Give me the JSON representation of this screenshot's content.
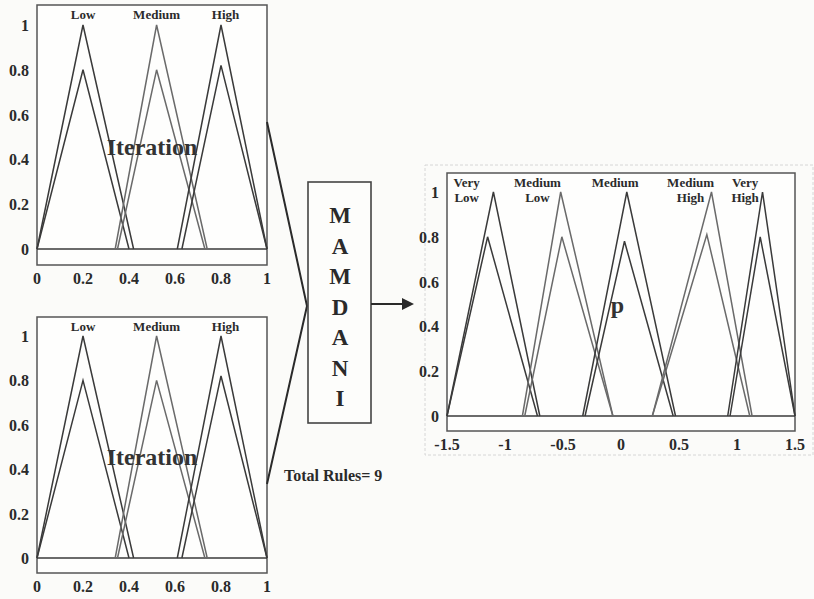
{
  "diagram": {
    "engine_label_letters": [
      "M",
      "A",
      "M",
      "D",
      "A",
      "N",
      "I"
    ],
    "total_rules_label": "Total Rules= 9",
    "colors": {
      "line": "#3a3a3a",
      "light_line": "#8a8a8a",
      "background": "#fbfbf9"
    }
  },
  "chart_data": [
    {
      "type": "line",
      "name": "input-1",
      "title": "Iteration",
      "xlim": [
        0,
        1
      ],
      "ylim": [
        0,
        1
      ],
      "xticks": [
        "0",
        "0.2",
        "0.4",
        "0.6",
        "0.8",
        "1"
      ],
      "yticks": [
        "0",
        "0.2",
        "0.4",
        "0.6",
        "0.8",
        "1"
      ],
      "series": [
        {
          "name": "Low",
          "label_x": 0.2,
          "outer": [
            [
              0,
              0
            ],
            [
              0.2,
              1
            ],
            [
              0.42,
              0
            ]
          ],
          "inner": [
            [
              0,
              0
            ],
            [
              0.2,
              0.8
            ],
            [
              0.4,
              0
            ]
          ]
        },
        {
          "name": "Medium",
          "label_x": 0.52,
          "outer": [
            [
              0.34,
              0
            ],
            [
              0.52,
              1
            ],
            [
              0.74,
              0
            ]
          ],
          "inner": [
            [
              0.35,
              0
            ],
            [
              0.52,
              0.8
            ],
            [
              0.73,
              0
            ]
          ]
        },
        {
          "name": "High",
          "label_x": 0.82,
          "outer": [
            [
              0.61,
              0
            ],
            [
              0.8,
              1
            ],
            [
              1.0,
              0
            ]
          ],
          "inner": [
            [
              0.63,
              0
            ],
            [
              0.8,
              0.82
            ],
            [
              1.0,
              0
            ]
          ]
        }
      ]
    },
    {
      "type": "line",
      "name": "input-2",
      "title": "Iteration",
      "xlim": [
        0,
        1
      ],
      "ylim": [
        0,
        1
      ],
      "xticks": [
        "0",
        "0.2",
        "0.4",
        "0.6",
        "0.8",
        "1"
      ],
      "yticks": [
        "0",
        "0.2",
        "0.4",
        "0.6",
        "0.8",
        "1"
      ],
      "series": [
        {
          "name": "Low",
          "label_x": 0.2,
          "outer": [
            [
              0,
              0
            ],
            [
              0.2,
              1
            ],
            [
              0.42,
              0
            ]
          ],
          "inner": [
            [
              0,
              0
            ],
            [
              0.2,
              0.8
            ],
            [
              0.4,
              0
            ]
          ]
        },
        {
          "name": "Medium",
          "label_x": 0.52,
          "outer": [
            [
              0.34,
              0
            ],
            [
              0.52,
              1
            ],
            [
              0.74,
              0
            ]
          ],
          "inner": [
            [
              0.35,
              0
            ],
            [
              0.52,
              0.8
            ],
            [
              0.73,
              0
            ]
          ]
        },
        {
          "name": "High",
          "label_x": 0.82,
          "outer": [
            [
              0.61,
              0
            ],
            [
              0.8,
              1
            ],
            [
              1.0,
              0
            ]
          ],
          "inner": [
            [
              0.63,
              0
            ],
            [
              0.8,
              0.82
            ],
            [
              1.0,
              0
            ]
          ]
        }
      ]
    },
    {
      "type": "line",
      "name": "output",
      "title": "p",
      "xlim": [
        -1.5,
        1.5
      ],
      "ylim": [
        0,
        1
      ],
      "xticks": [
        "-1.5",
        "-1",
        "-0.5",
        "0",
        "0.5",
        "1",
        "1.5"
      ],
      "yticks": [
        "0",
        "0.2",
        "0.4",
        "0.6",
        "0.8",
        "1"
      ],
      "series": [
        {
          "name": "Very Low",
          "label_lines": [
            "Very",
            "Low"
          ],
          "label_x": -1.33,
          "outer": [
            [
              -1.5,
              0
            ],
            [
              -1.1,
              1
            ],
            [
              -0.7,
              0
            ]
          ],
          "inner": [
            [
              -1.5,
              0
            ],
            [
              -1.15,
              0.8
            ],
            [
              -0.72,
              0
            ]
          ]
        },
        {
          "name": "Medium Low",
          "label_lines": [
            "Medium",
            "Low"
          ],
          "label_x": -0.72,
          "outer": [
            [
              -0.85,
              0
            ],
            [
              -0.52,
              1
            ],
            [
              -0.07,
              0
            ]
          ],
          "inner": [
            [
              -0.83,
              0
            ],
            [
              -0.51,
              0.8
            ],
            [
              -0.07,
              0
            ]
          ]
        },
        {
          "name": "Medium",
          "label_lines": [
            "Medium"
          ],
          "label_x": -0.05,
          "outer": [
            [
              -0.33,
              0
            ],
            [
              0.05,
              1
            ],
            [
              0.47,
              0
            ]
          ],
          "inner": [
            [
              -0.31,
              0
            ],
            [
              0.03,
              0.78
            ],
            [
              0.45,
              0
            ]
          ]
        },
        {
          "name": "Medium High",
          "label_lines": [
            "Medium",
            "High"
          ],
          "label_x": 0.6,
          "outer": [
            [
              0.27,
              0
            ],
            [
              0.78,
              1
            ],
            [
              1.13,
              0
            ]
          ],
          "inner": [
            [
              0.27,
              0
            ],
            [
              0.74,
              0.81
            ],
            [
              1.11,
              0
            ]
          ]
        },
        {
          "name": "Very High",
          "label_lines": [
            "Very",
            "High"
          ],
          "label_x": 1.07,
          "outer": [
            [
              0.92,
              0
            ],
            [
              1.22,
              1
            ],
            [
              1.5,
              0
            ]
          ],
          "inner": [
            [
              0.94,
              0
            ],
            [
              1.2,
              0.8
            ],
            [
              1.5,
              0
            ]
          ]
        }
      ]
    }
  ]
}
